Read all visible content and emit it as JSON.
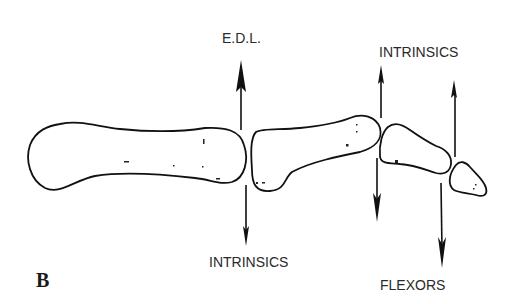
{
  "figure": {
    "panel_label": "B",
    "labels": {
      "edl": "E.D.L.",
      "intrinsics_top": "INTRINSICS",
      "intrinsics_bottom": "INTRINSICS",
      "flexors": "FLEXORS"
    },
    "bones": [
      {
        "name": "proximal-phalanx"
      },
      {
        "name": "middle-phalanx"
      },
      {
        "name": "distal-phalanx"
      },
      {
        "name": "tip-phalanx"
      }
    ],
    "arrows": [
      {
        "name": "edl-arrow",
        "direction": "up",
        "label": "E.D.L."
      },
      {
        "name": "intrinsics-lower-arrow",
        "direction": "down",
        "label": "INTRINSICS"
      },
      {
        "name": "intrinsics-upper-arrow",
        "direction": "up",
        "label": "INTRINSICS"
      },
      {
        "name": "middle-down-arrow",
        "direction": "down"
      },
      {
        "name": "distal-up-arrow",
        "direction": "up"
      },
      {
        "name": "flexors-arrow",
        "direction": "down",
        "label": "FLEXORS"
      }
    ],
    "colors": {
      "ink": "#111111",
      "background": "#ffffff"
    }
  }
}
